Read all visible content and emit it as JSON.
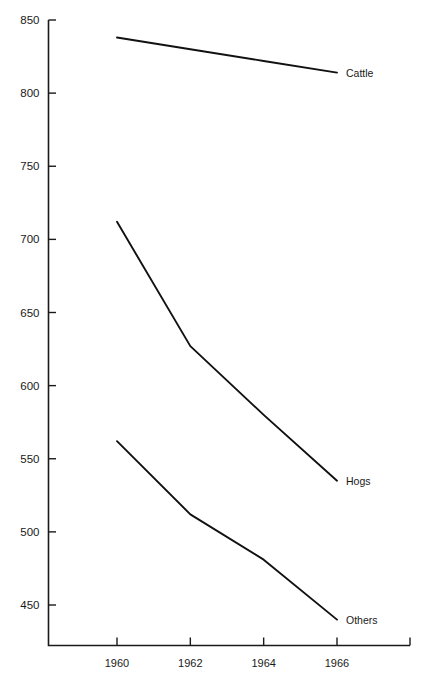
{
  "chart_data": {
    "type": "line",
    "title": "",
    "subtitle": "",
    "xlabel": "",
    "ylabel": "",
    "x": [
      1960,
      1962,
      1964,
      1966
    ],
    "categories": [
      "1960",
      "1962",
      "1964",
      "1966"
    ],
    "xlim": [
      1959.4,
      1967.9
    ],
    "ylim": [
      425,
      850
    ],
    "yticks": [
      450,
      500,
      550,
      600,
      650,
      700,
      750,
      800,
      850
    ],
    "ytick_labels": [
      "450",
      "500",
      "550",
      "600",
      "650",
      "700",
      "750",
      "800",
      "850"
    ],
    "xticks": [
      1960,
      1962,
      1964,
      1966
    ],
    "xtick_labels": [
      "1960",
      "1962",
      "1964",
      "1966"
    ],
    "grid": false,
    "legend_position": "inline-right-of-line-end",
    "line_color": "#111111",
    "axis_color": "#1a1a1a",
    "series": [
      {
        "name": "Cattle",
        "label": "Cattle",
        "values": [
          838,
          830,
          822,
          814
        ],
        "label_point": {
          "x": 1966,
          "y": 814
        }
      },
      {
        "name": "Hogs",
        "label": "Hogs",
        "values": [
          712,
          627,
          580,
          535
        ],
        "label_point": {
          "x": 1966,
          "y": 535
        }
      },
      {
        "name": "Others",
        "label": "Others",
        "values": [
          562,
          512,
          481,
          440
        ],
        "label_point": {
          "x": 1966,
          "y": 440
        }
      }
    ]
  },
  "labels": {
    "cattle": "Cattle",
    "hogs": "Hogs",
    "others": "Others"
  }
}
